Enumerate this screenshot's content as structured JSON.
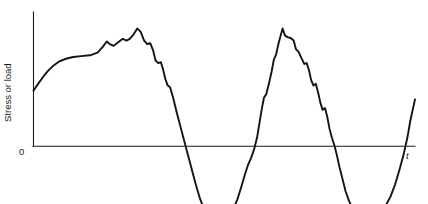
{
  "chart_data": {
    "type": "line",
    "title": "",
    "subtitle": "",
    "xlabel": "t",
    "ylabel": "Stress or load",
    "y_zero_label": "0",
    "grid": false,
    "legend": null,
    "axis_color": "#1a1a1a",
    "curve_color": "#141414",
    "background_color": "#ffffff",
    "axis_ranges": {
      "x": [
        0,
        1
      ],
      "y": [
        -1.0,
        1.55
      ]
    },
    "series": [
      {
        "name": "stress history",
        "points": [
          [
            0.0,
            0.64
          ],
          [
            0.012,
            0.72
          ],
          [
            0.025,
            0.8
          ],
          [
            0.038,
            0.87
          ],
          [
            0.052,
            0.93
          ],
          [
            0.068,
            0.98
          ],
          [
            0.085,
            1.01
          ],
          [
            0.104,
            1.03
          ],
          [
            0.125,
            1.04
          ],
          [
            0.148,
            1.05
          ],
          [
            0.168,
            1.08
          ],
          [
            0.182,
            1.15
          ],
          [
            0.192,
            1.21
          ],
          [
            0.2,
            1.18
          ],
          [
            0.21,
            1.16
          ],
          [
            0.222,
            1.2
          ],
          [
            0.234,
            1.24
          ],
          [
            0.244,
            1.22
          ],
          [
            0.252,
            1.24
          ],
          [
            0.262,
            1.29
          ],
          [
            0.272,
            1.36
          ],
          [
            0.281,
            1.32
          ],
          [
            0.29,
            1.22
          ],
          [
            0.298,
            1.18
          ],
          [
            0.306,
            1.19
          ],
          [
            0.314,
            1.1
          ],
          [
            0.32,
            0.99
          ],
          [
            0.327,
            0.96
          ],
          [
            0.334,
            0.97
          ],
          [
            0.34,
            0.88
          ],
          [
            0.346,
            0.77
          ],
          [
            0.352,
            0.7
          ],
          [
            0.358,
            0.68
          ],
          [
            0.366,
            0.56
          ],
          [
            0.376,
            0.38
          ],
          [
            0.388,
            0.18
          ],
          [
            0.4,
            -0.02
          ],
          [
            0.412,
            -0.22
          ],
          [
            0.424,
            -0.42
          ],
          [
            0.436,
            -0.6
          ],
          [
            0.448,
            -0.74
          ],
          [
            0.46,
            -0.84
          ],
          [
            0.472,
            -0.89
          ],
          [
            0.484,
            -0.87
          ],
          [
            0.496,
            -0.8
          ],
          [
            0.508,
            -0.73
          ],
          [
            0.518,
            -0.68
          ],
          [
            0.526,
            -0.7
          ],
          [
            0.534,
            -0.62
          ],
          [
            0.544,
            -0.48
          ],
          [
            0.554,
            -0.33
          ],
          [
            0.562,
            -0.22
          ],
          [
            0.57,
            -0.14
          ],
          [
            0.578,
            -0.04
          ],
          [
            0.586,
            0.1
          ],
          [
            0.592,
            0.26
          ],
          [
            0.598,
            0.42
          ],
          [
            0.604,
            0.56
          ],
          [
            0.61,
            0.6
          ],
          [
            0.617,
            0.72
          ],
          [
            0.624,
            0.86
          ],
          [
            0.63,
            1.0
          ],
          [
            0.636,
            1.06
          ],
          [
            0.642,
            1.18
          ],
          [
            0.648,
            1.28
          ],
          [
            0.653,
            1.36
          ],
          [
            0.659,
            1.28
          ],
          [
            0.666,
            1.26
          ],
          [
            0.674,
            1.25
          ],
          [
            0.682,
            1.22
          ],
          [
            0.688,
            1.12
          ],
          [
            0.695,
            1.09
          ],
          [
            0.702,
            1.02
          ],
          [
            0.71,
            0.95
          ],
          [
            0.716,
            0.96
          ],
          [
            0.722,
            0.88
          ],
          [
            0.728,
            0.76
          ],
          [
            0.734,
            0.7
          ],
          [
            0.74,
            0.72
          ],
          [
            0.746,
            0.62
          ],
          [
            0.752,
            0.5
          ],
          [
            0.758,
            0.42
          ],
          [
            0.764,
            0.44
          ],
          [
            0.77,
            0.34
          ],
          [
            0.776,
            0.2
          ],
          [
            0.782,
            0.1
          ],
          [
            0.788,
            0.02
          ],
          [
            0.795,
            -0.1
          ],
          [
            0.802,
            -0.24
          ],
          [
            0.81,
            -0.38
          ],
          [
            0.818,
            -0.52
          ],
          [
            0.826,
            -0.62
          ],
          [
            0.834,
            -0.7
          ],
          [
            0.842,
            -0.76
          ],
          [
            0.85,
            -0.78
          ],
          [
            0.858,
            -0.74
          ],
          [
            0.866,
            -0.78
          ],
          [
            0.876,
            -0.79
          ],
          [
            0.888,
            -0.77
          ],
          [
            0.9,
            -0.76
          ],
          [
            0.912,
            -0.74
          ],
          [
            0.924,
            -0.68
          ],
          [
            0.936,
            -0.58
          ],
          [
            0.948,
            -0.44
          ],
          [
            0.96,
            -0.26
          ],
          [
            0.97,
            -0.1
          ],
          [
            0.98,
            0.1
          ],
          [
            0.988,
            0.3
          ],
          [
            0.996,
            0.46
          ],
          [
            1.0,
            0.54
          ]
        ]
      }
    ]
  }
}
